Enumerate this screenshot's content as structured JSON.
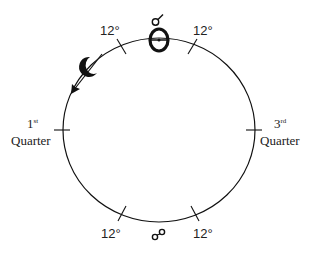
{
  "diagram": {
    "type": "lunar-phase-orbit",
    "symbols": {
      "conjunction": "☌",
      "opposition": "☍",
      "sun": "☉",
      "moon": "☽"
    },
    "labels": {
      "top_left_degree": "12°",
      "top_right_degree": "12°",
      "bottom_left_degree": "12°",
      "bottom_right_degree": "12°",
      "first_quarter_number": "1",
      "first_quarter_suffix": "st",
      "first_quarter_word": "Quarter",
      "third_quarter_number": "3",
      "third_quarter_suffix": "rd",
      "third_quarter_word": "Quarter"
    },
    "colors": {
      "stroke": "#111111",
      "text": "#222222",
      "background": "#ffffff"
    }
  }
}
